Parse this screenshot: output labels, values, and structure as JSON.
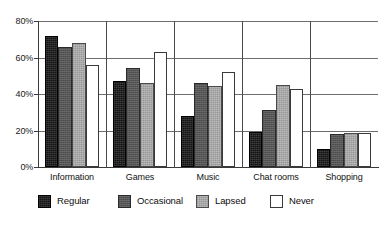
{
  "chart_data": {
    "type": "bar",
    "title": "",
    "subtitle": "",
    "xlabel": "",
    "ylabel": "",
    "categories": [
      "Information",
      "Games",
      "Music",
      "Chat rooms",
      "Shopping"
    ],
    "series": [
      {
        "name": "Regular",
        "color": "#141414",
        "values": [
          72,
          47,
          28,
          19,
          10
        ]
      },
      {
        "name": "Occasional",
        "color": "#555555",
        "values": [
          66,
          54,
          46,
          31,
          18
        ]
      },
      {
        "name": "Lapsed",
        "color": "#a8a8a8",
        "values": [
          68,
          46,
          44.5,
          45,
          18.5
        ]
      },
      {
        "name": "Never",
        "color": "#ffffff",
        "values": [
          56,
          63,
          52,
          43,
          18.5
        ]
      }
    ],
    "ylim": [
      0,
      80
    ],
    "y_ticks": [
      0,
      20,
      40,
      60,
      80
    ],
    "y_tick_labels": [
      "0%",
      "20%",
      "40%",
      "60%",
      "80%"
    ],
    "grid": true,
    "grid_axis": "y",
    "legend_position": "bottom",
    "value_suffix": "%"
  }
}
